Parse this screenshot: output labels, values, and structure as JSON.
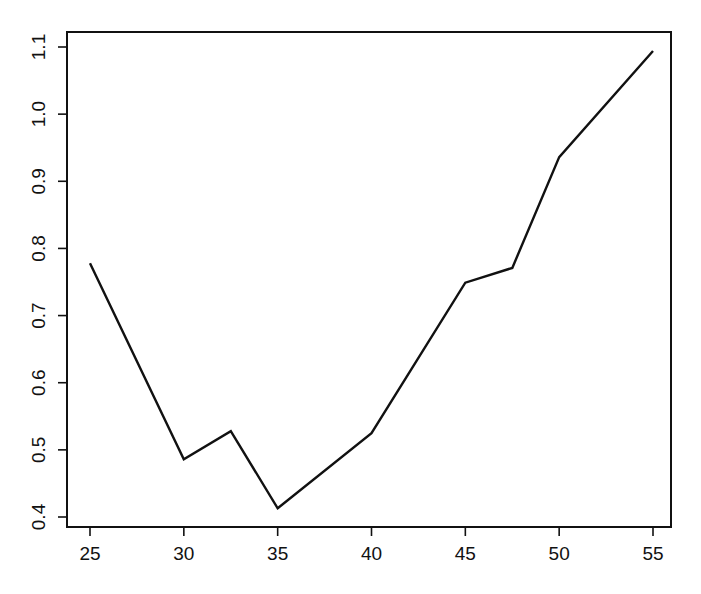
{
  "chart_data": {
    "type": "line",
    "title": "",
    "xlabel": "",
    "ylabel": "",
    "x": [
      25,
      30,
      32.5,
      35,
      40,
      45,
      47.5,
      50,
      55
    ],
    "series": [
      {
        "name": "series",
        "values": [
          0.778,
          0.486,
          0.528,
          0.413,
          0.525,
          0.749,
          0.771,
          0.936,
          1.094
        ],
        "color": "#111111"
      }
    ],
    "xlim": [
      23.8,
      56.2
    ],
    "ylim": [
      0.385,
      1.115
    ],
    "xticks": [
      25,
      30,
      35,
      40,
      45,
      50,
      55
    ],
    "xtick_labels": [
      "25",
      "30",
      "35",
      "40",
      "45",
      "50",
      "55"
    ],
    "yticks": [
      0.4,
      0.5,
      0.6,
      0.7,
      0.8,
      0.9,
      1.0,
      1.1
    ],
    "ytick_labels": [
      "0.4",
      "0.5",
      "0.6",
      "0.7",
      "0.8",
      "0.9",
      "1.0",
      "1.1"
    ],
    "grid": false,
    "legend": null
  },
  "layout": {
    "plot_box": {
      "left": 67,
      "top": 32,
      "right": 671,
      "bottom": 527
    },
    "x_px": {
      "v0": 25,
      "p0": 90,
      "v1": 55,
      "p1": 653
    },
    "y_px": {
      "v0": 0.4,
      "p0": 517,
      "v1": 1.1,
      "p1": 47
    }
  }
}
